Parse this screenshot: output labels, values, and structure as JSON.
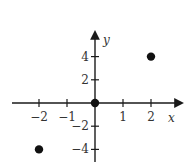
{
  "chart_data": {
    "type": "scatter",
    "title": "",
    "xlabel": "x",
    "ylabel": "y",
    "xlim": [
      -2.9,
      3.1
    ],
    "ylim": [
      -5,
      6
    ],
    "grid": false,
    "legend": null,
    "x_ticks": [
      -2,
      -1,
      1,
      2
    ],
    "x_tick_labels": [
      "−2",
      "−1",
      "1",
      "2"
    ],
    "y_ticks": [
      4,
      2,
      -2,
      -4
    ],
    "y_tick_labels": [
      "4",
      "2",
      "−2",
      "−4"
    ],
    "series": [
      {
        "name": "points",
        "x": [
          -2,
          0,
          2
        ],
        "y": [
          -4,
          0,
          4
        ]
      }
    ],
    "colors": {
      "axis": "#1a1a1a",
      "points": "#111111",
      "text": "#333333"
    }
  }
}
